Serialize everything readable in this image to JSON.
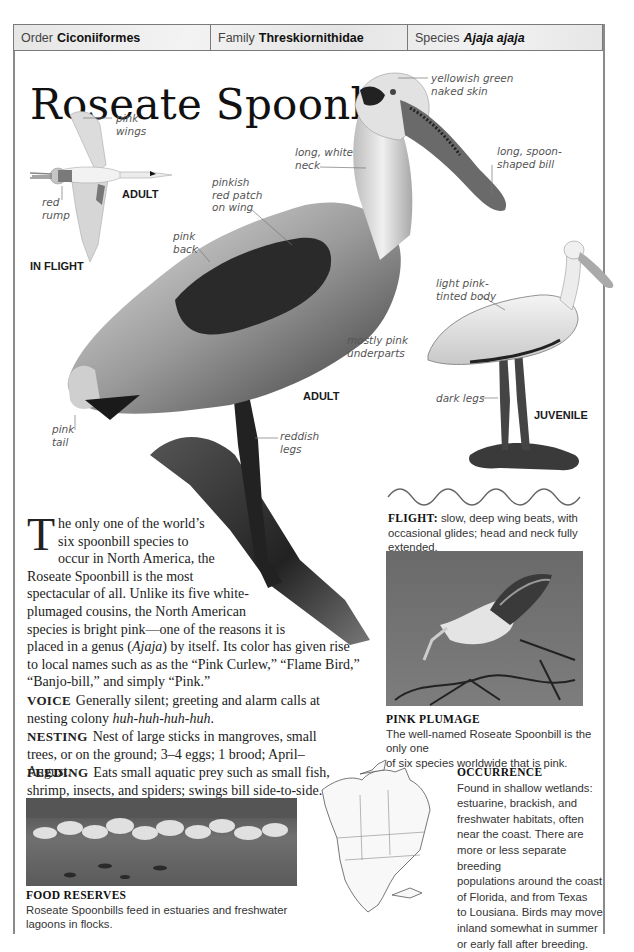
{
  "header": {
    "order_label": "Order",
    "order_value": "Ciconiiformes",
    "family_label": "Family",
    "family_value": "Threskiornithidae",
    "species_label": "Species",
    "species_value": "Ajaja ajaja"
  },
  "title": "Roseate Spoonbill",
  "illustration_labels": {
    "in_flight": {
      "pink_wings_1": "pink",
      "pink_wings_2": "wings",
      "red_rump_1": "red",
      "red_rump_2": "rump",
      "adult_tag": "ADULT",
      "in_flight_tag": "IN FLIGHT"
    },
    "adult": {
      "naked_skin_1": "yellowish green",
      "naked_skin_2": "naked skin",
      "neck_1": "long, white",
      "neck_2": "neck",
      "bill_1": "long, spoon-",
      "bill_2": "shaped bill",
      "patch_1": "pinkish",
      "patch_2": "red patch",
      "patch_3": "on wing",
      "back_1": "pink",
      "back_2": "back",
      "underparts_1": "mostly pink",
      "underparts_2": "underparts",
      "tail_1": "pink",
      "tail_2": "tail",
      "legs_1": "reddish",
      "legs_2": "legs",
      "adult_tag": "ADULT"
    },
    "juvenile": {
      "body_1": "light pink-",
      "body_2": "tinted body",
      "legs": "dark legs",
      "juvenile_tag": "JUVENILE"
    }
  },
  "flight": {
    "heading": "FLIGHT:",
    "line1": "slow, deep wing beats, with",
    "line2": "occasional glides; head and neck fully extended."
  },
  "intro": {
    "drop_cap": "T",
    "lines": [
      "he only one of the world’s",
      "six spoonbill species to",
      "occur in North America, the",
      "Roseate Spoonbill is the most",
      "spectacular of all. Unlike its five white-",
      "plumaged cousins, the North American",
      "species is bright pink—one of the reasons it is"
    ],
    "line8_a": "placed in a genus (",
    "line8_genus": "Ajaja",
    "line8_b": ") by itself. Its color has given rise",
    "line9": "to local names such as as the “Pink Curlew,” “Flame Bird,”",
    "line10": "“Banjo-bill,” and simply “Pink.”"
  },
  "voice": {
    "heading": "VOICE",
    "text": "Generally silent; greeting and alarm calls at nesting colony ",
    "call": "huh-huh-huh-huh",
    "end": "."
  },
  "nesting": {
    "heading": "NESTING",
    "text": "Nest of large sticks in mangroves, small trees, or on the ground; 3–4 eggs; 1 brood; April–August."
  },
  "feeding": {
    "heading": "FEEDING",
    "text": "Eats small aquatic prey such as small fish, shrimp, insects, and spiders; swings bill side-to-side."
  },
  "pink_plumage": {
    "heading": "PINK PLUMAGE",
    "line1": "The well-named Roseate Spoonbill is the only one",
    "line2": "of six species worldwide that is pink."
  },
  "food_reserves": {
    "heading": "FOOD RESERVES",
    "text": "Roseate Spoonbills feed in estuaries and freshwater lagoons in flocks."
  },
  "occurrence": {
    "heading": "OCCURRENCE",
    "lines": [
      "Found in shallow wetlands:",
      "estuarine, brackish, and",
      "freshwater habitats, often",
      "near the coast. There are",
      "more or less separate breeding",
      "populations around the coast",
      "of Florida, and from Texas",
      "to Lousiana. Birds may move",
      "inland somewhat in summer",
      "or early fall after breeding."
    ]
  },
  "colors": {
    "border": "#8a8a8a",
    "header_bg": "#ececec",
    "text": "#222222",
    "label": "#555555"
  }
}
